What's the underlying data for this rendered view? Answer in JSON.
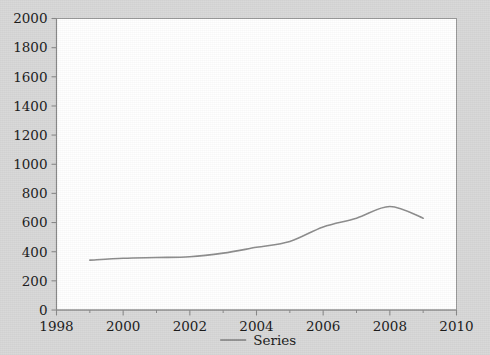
{
  "chart_data": {
    "type": "line",
    "title": "",
    "xlabel": "",
    "ylabel": "",
    "xlim": [
      1998,
      2010
    ],
    "ylim": [
      0,
      2000
    ],
    "grid": false,
    "legend_position": "bottom-center",
    "xticks": [
      1998,
      2000,
      2002,
      2004,
      2006,
      2008,
      2010
    ],
    "xtick_labels": [
      "1998",
      "2000",
      "2002",
      "2004",
      "2006",
      "2008",
      "2010"
    ],
    "xminor_ticks": [
      1999,
      2001,
      2003,
      2005,
      2007,
      2009
    ],
    "yticks": [
      0,
      200,
      400,
      600,
      800,
      1000,
      1200,
      1400,
      1600,
      1800,
      2000
    ],
    "ytick_labels": [
      "0",
      "200",
      "400",
      "600",
      "800",
      "1000",
      "1200",
      "1400",
      "1600",
      "1800",
      "2000"
    ],
    "series": [
      {
        "name": "Series",
        "color": "#8d8d8d",
        "x": [
          1999,
          2000,
          2001,
          2002,
          2003,
          2004,
          2005,
          2006,
          2007,
          2008,
          2009
        ],
        "values": [
          342,
          355,
          360,
          365,
          390,
          430,
          470,
          570,
          630,
          710,
          630
        ]
      }
    ],
    "legend": [
      {
        "label": "Series",
        "color": "#8d8d8d"
      }
    ],
    "colors": {
      "background": "#d8d8d8",
      "plot_background": "#ffffff",
      "axis": "#8a8a8a",
      "text": "#1b1b1b",
      "series": "#8d8d8d"
    }
  }
}
